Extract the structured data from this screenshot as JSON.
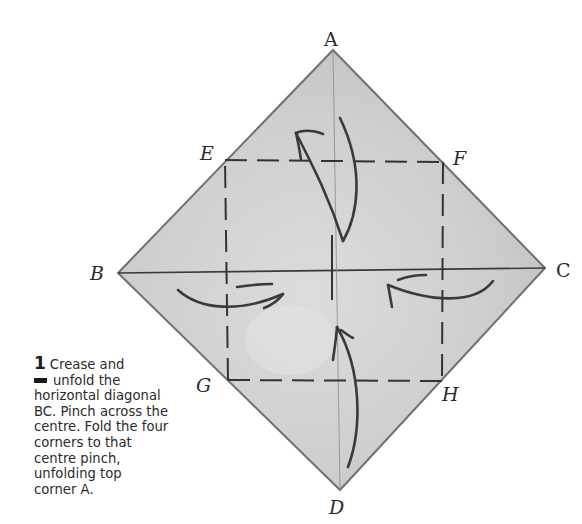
{
  "diagram": {
    "points": {
      "A": {
        "label": "A",
        "x": 333,
        "y": 50
      },
      "B": {
        "label": "B",
        "x": 118,
        "y": 273
      },
      "C": {
        "label": "C",
        "x": 545,
        "y": 268
      },
      "D": {
        "label": "D",
        "x": 340,
        "y": 490
      },
      "E": {
        "label": "E",
        "x": 225,
        "y": 160
      },
      "F": {
        "label": "F",
        "x": 443,
        "y": 162
      },
      "G": {
        "label": "G",
        "x": 228,
        "y": 380
      },
      "H": {
        "label": "H",
        "x": 442,
        "y": 381
      }
    },
    "colors": {
      "paper": "#c9c9c9",
      "paper_light": "#dedede",
      "edge": "#6e6e6e",
      "line": "#3a3a3a"
    }
  },
  "caption": {
    "step_number": "1",
    "lines": [
      "Crease and",
      "unfold the",
      "horizontal diagonal",
      "BC. Pinch across the",
      "centre. Fold the four",
      "corners to that",
      "centre pinch,",
      "unfolding top",
      "corner A."
    ]
  }
}
